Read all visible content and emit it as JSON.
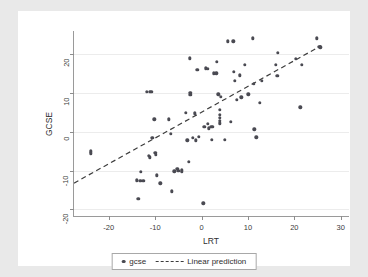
{
  "chart_data": {
    "type": "scatter",
    "title": "",
    "xlabel": "LRT",
    "ylabel": "GCSE",
    "xlim": [
      -27.5,
      32.0
    ],
    "ylim": [
      -22.0,
      26.0
    ],
    "xticks": [
      -20,
      -10,
      0,
      10,
      20,
      30
    ],
    "yticks": [
      -20,
      -10,
      0,
      10,
      20
    ],
    "grid": "horizontal",
    "legend_position": "bottom-center",
    "series": [
      {
        "name": "gcse",
        "type": "scatter",
        "marker": "circle",
        "color": "#4a4a52",
        "points": [
          [
            -23.9,
            -5.0
          ],
          [
            -23.9,
            -5.6
          ],
          [
            -13.6,
            -17.3
          ],
          [
            -13.9,
            -12.5
          ],
          [
            -13.2,
            -12.6
          ],
          [
            -12.6,
            -12.6
          ],
          [
            -13.1,
            -10.3
          ],
          [
            -11.8,
            10.3
          ],
          [
            -11.2,
            10.3
          ],
          [
            -10.8,
            10.3
          ],
          [
            -11.4,
            -6.2
          ],
          [
            -11.2,
            -6.6
          ],
          [
            -10.6,
            -1.5
          ],
          [
            -10.2,
            3.2
          ],
          [
            -10.0,
            -5.5
          ],
          [
            -9.8,
            -5.9
          ],
          [
            -9.6,
            -11.2
          ],
          [
            -8.9,
            -13.3
          ],
          [
            -7.0,
            3.2
          ],
          [
            -6.6,
            -0.6
          ],
          [
            -6.4,
            -15.4
          ],
          [
            -5.9,
            -10.2
          ],
          [
            -5.2,
            -9.6
          ],
          [
            -5.0,
            -10.0
          ],
          [
            -4.3,
            -9.9
          ],
          [
            -4.2,
            -10.4
          ],
          [
            -3.4,
            4.9
          ],
          [
            -3.1,
            -2.2
          ],
          [
            -2.8,
            -7.8
          ],
          [
            -2.6,
            19.0
          ],
          [
            -2.4,
            10.0
          ],
          [
            -2.4,
            9.6
          ],
          [
            -1.9,
            -1.6
          ],
          [
            -1.4,
            4.8
          ],
          [
            -1.3,
            -2.2
          ],
          [
            -0.9,
            16.0
          ],
          [
            -0.6,
            -1.3
          ],
          [
            0.4,
            -18.5
          ],
          [
            0.6,
            1.3
          ],
          [
            0.9,
            16.4
          ],
          [
            1.3,
            16.3
          ],
          [
            1.4,
            2.1
          ],
          [
            1.6,
            0.9
          ],
          [
            2.1,
            1.2
          ],
          [
            2.4,
            1.2
          ],
          [
            2.2,
            -2.1
          ],
          [
            2.6,
            15.1
          ],
          [
            3.2,
            15.1
          ],
          [
            3.3,
            18.0
          ],
          [
            3.6,
            9.7
          ],
          [
            3.9,
            5.6
          ],
          [
            3.9,
            4.4
          ],
          [
            3.9,
            3.6
          ],
          [
            3.9,
            2.9
          ],
          [
            3.9,
            2.2
          ],
          [
            4.2,
            9.0
          ],
          [
            5.0,
            -2.1
          ],
          [
            5.6,
            23.3
          ],
          [
            6.3,
            2.6
          ],
          [
            6.8,
            23.3
          ],
          [
            7.0,
            15.4
          ],
          [
            7.2,
            13.2
          ],
          [
            7.6,
            8.3
          ],
          [
            8.2,
            14.6
          ],
          [
            8.6,
            8.9
          ],
          [
            9.3,
            17.3
          ],
          [
            10.1,
            9.7
          ],
          [
            11.0,
            24.1
          ],
          [
            11.2,
            12.3
          ],
          [
            11.4,
            0.6
          ],
          [
            11.8,
            -1.4
          ],
          [
            12.6,
            7.4
          ],
          [
            13.0,
            13.1
          ],
          [
            16.0,
            17.2
          ],
          [
            16.3,
            14.5
          ],
          [
            16.5,
            20.4
          ],
          [
            20.3,
            18.9
          ],
          [
            21.3,
            6.3
          ],
          [
            21.6,
            17.2
          ],
          [
            24.9,
            24.1
          ],
          [
            25.4,
            22.0
          ],
          [
            25.6,
            21.8
          ]
        ]
      },
      {
        "name": "Linear prediction",
        "type": "line",
        "style": "dashed",
        "color": "#3c3c3c",
        "endpoints": [
          [
            -27.5,
            -13.4
          ],
          [
            26.0,
            22.2
          ]
        ],
        "slope": 0.665,
        "intercept": 4.9
      }
    ],
    "legend": [
      {
        "label": "gcse",
        "marker": "dot"
      },
      {
        "label": "Linear prediction",
        "marker": "dashed-line"
      }
    ]
  },
  "colors": {
    "page_background": "#e9e9e9",
    "card_background": "#ffffff",
    "plot_background": "#ffffff",
    "axis": "#9a9a9a",
    "gridline": "#ececec",
    "marker": "#4a4a52",
    "fit_line": "#3c3c3c",
    "text": "#2e2e2e"
  }
}
